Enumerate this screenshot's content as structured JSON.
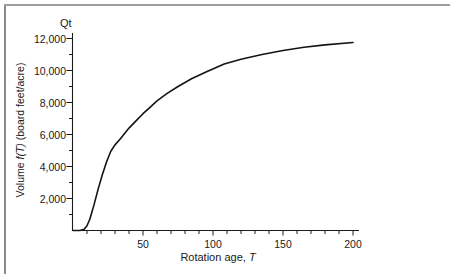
{
  "figure": {
    "corner_label": "Qt"
  },
  "chart_data": {
    "type": "line",
    "title": "",
    "xlabel": "Rotation age, T",
    "ylabel": "Volume f(T) (board feet/acre)",
    "xlabel_parts": [
      {
        "text": "Rotation age, ",
        "italic": false
      },
      {
        "text": "T",
        "italic": true
      }
    ],
    "ylabel_parts": [
      {
        "text": "Volume ",
        "italic": false
      },
      {
        "text": "f(T)",
        "italic": true
      },
      {
        "text": " (board feet/acre)",
        "italic": false
      }
    ],
    "xlim": [
      0,
      204
    ],
    "ylim": [
      0,
      12600
    ],
    "x_ticks": [
      50,
      100,
      150,
      200
    ],
    "x_tick_labels": [
      "50",
      "100",
      "150",
      "200"
    ],
    "x_minor_step": 10,
    "y_ticks": [
      2000,
      4000,
      6000,
      8000,
      10000,
      12000
    ],
    "y_tick_labels": [
      "2,000",
      "4,000",
      "6,000",
      "8,000",
      "10,000",
      "12,000"
    ],
    "y_minor_step": 1000,
    "grid": false,
    "legend": "none",
    "line_color": "#141414",
    "axis_color": "#1a1a1a",
    "series": [
      {
        "name": "f(T)",
        "x": [
          0,
          5,
          8,
          10,
          12,
          15,
          18,
          21,
          24,
          27,
          30,
          34,
          40,
          45,
          50,
          55,
          60,
          67,
          75,
          85,
          95,
          108,
          120,
          135,
          150,
          165,
          180,
          200
        ],
        "y": [
          0,
          0,
          80,
          300,
          700,
          1600,
          2600,
          3500,
          4300,
          4950,
          5350,
          5750,
          6400,
          6850,
          7300,
          7700,
          8100,
          8550,
          9000,
          9500,
          9900,
          10400,
          10700,
          11000,
          11250,
          11450,
          11600,
          11750
        ]
      }
    ]
  }
}
